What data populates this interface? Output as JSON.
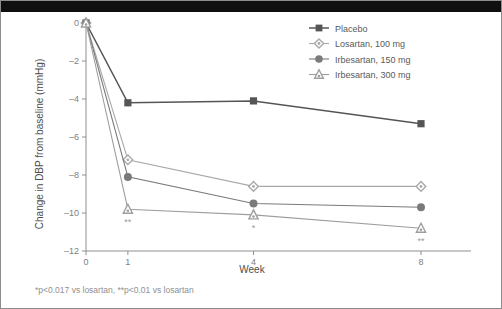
{
  "figure": {
    "background_color": "#ffffff",
    "border_color": "#8c8c8c",
    "top_band_color": "#0f0f0f"
  },
  "footnote": {
    "text": "*p<0.017 vs losartan, **p<0.01 vs losartan"
  },
  "legend": {
    "position": "top-right",
    "entries": [
      {
        "label": "Placebo",
        "marker": "square",
        "color": "#555555"
      },
      {
        "label": "Losartan, 100 mg",
        "marker": "diamond",
        "color": "#a9a9a9"
      },
      {
        "label": "Irbesartan, 150 mg",
        "marker": "circle",
        "color": "#7a7a7a"
      },
      {
        "label": "Irbesartan, 300 mg",
        "marker": "triangle",
        "color": "#9e9e9e"
      }
    ]
  },
  "chart_data": {
    "type": "line",
    "title": "",
    "xlabel": "Week",
    "ylabel": "Change in DBP from baseline (mmHg)",
    "x": [
      0,
      1,
      4,
      8
    ],
    "xtick_labels": [
      "0",
      "1",
      "4",
      "8"
    ],
    "ytick_labels": [
      "0",
      "–2",
      "–4",
      "–6",
      "–8",
      "–10",
      "–12"
    ],
    "ytick_values": [
      0,
      -2,
      -4,
      -6,
      -8,
      -10,
      -12
    ],
    "xlim": [
      0,
      8.6
    ],
    "ylim": [
      -12,
      0
    ],
    "grid": false,
    "legend_position": "top-right",
    "series": [
      {
        "name": "Placebo",
        "marker": "square",
        "color": "#555555",
        "values": [
          0,
          -4.2,
          -4.1,
          -5.3
        ]
      },
      {
        "name": "Losartan, 100 mg",
        "marker": "diamond",
        "color": "#a9a9a9",
        "values": [
          0,
          -7.2,
          -8.6,
          -8.6
        ]
      },
      {
        "name": "Irbesartan, 150 mg",
        "marker": "circle",
        "color": "#7a7a7a",
        "values": [
          0,
          -8.1,
          -9.5,
          -9.7
        ]
      },
      {
        "name": "Irbesartan, 300 mg",
        "marker": "triangle",
        "color": "#9e9e9e",
        "values": [
          0,
          -9.8,
          -10.1,
          -10.8
        ]
      }
    ],
    "annotations": [
      {
        "text": "**",
        "x": 1,
        "y": -9.8,
        "series": "Irbesartan, 300 mg"
      },
      {
        "text": "*",
        "x": 4,
        "y": -10.1,
        "series": "Irbesartan, 300 mg"
      },
      {
        "text": "**",
        "x": 8,
        "y": -10.8,
        "series": "Irbesartan, 300 mg"
      }
    ]
  }
}
